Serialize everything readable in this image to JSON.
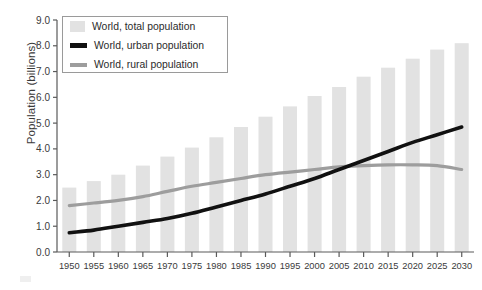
{
  "axes": {
    "ylabel": "Population (billions)",
    "yticks": [
      "0.0",
      "1.0",
      "2.0",
      "3.0",
      "4.0",
      "5.0",
      "6.0",
      "7.0",
      "8.0",
      "9.0"
    ],
    "xticks": [
      "1950",
      "1955",
      "1960",
      "1965",
      "1970",
      "1975",
      "1980",
      "1985",
      "1990",
      "1995",
      "2000",
      "2005",
      "2010",
      "2015",
      "2020",
      "2025",
      "2030"
    ]
  },
  "legend": {
    "items": [
      {
        "label": "World, total population",
        "marker": "total-swatch-icon"
      },
      {
        "label": "World, urban population",
        "marker": "urban-line-icon"
      },
      {
        "label": "World, rural population",
        "marker": "rural-line-icon"
      }
    ]
  },
  "colors": {
    "bar": "#e2e2e2",
    "urban": "#111111",
    "rural": "#9d9d9d",
    "axis": "#5a5a5a",
    "text": "#3a3a3a",
    "background": "#ffffff"
  },
  "chart_data": {
    "type": "bar",
    "title": "",
    "xlabel": "",
    "ylabel": "Population (billions)",
    "ylim": [
      0,
      9
    ],
    "xlim": [
      1950,
      2030
    ],
    "grid": false,
    "legend_position": "top-left",
    "categories": [
      "1950",
      "1955",
      "1960",
      "1965",
      "1970",
      "1975",
      "1980",
      "1985",
      "1990",
      "1995",
      "2000",
      "2005",
      "2010",
      "2015",
      "2020",
      "2025",
      "2030"
    ],
    "series": [
      {
        "name": "World, total population",
        "render": "bar",
        "color": "#e2e2e2",
        "values": [
          2.5,
          2.75,
          3.0,
          3.35,
          3.7,
          4.05,
          4.45,
          4.85,
          5.25,
          5.65,
          6.05,
          6.4,
          6.8,
          7.15,
          7.5,
          7.85,
          8.1
        ]
      },
      {
        "name": "World, urban population",
        "render": "line",
        "color": "#111111",
        "values": [
          0.75,
          0.85,
          1.0,
          1.15,
          1.3,
          1.5,
          1.75,
          2.0,
          2.25,
          2.55,
          2.85,
          3.2,
          3.55,
          3.9,
          4.25,
          4.55,
          4.85
        ]
      },
      {
        "name": "World, rural population",
        "render": "line",
        "color": "#9d9d9d",
        "values": [
          1.8,
          1.9,
          2.0,
          2.15,
          2.35,
          2.55,
          2.7,
          2.85,
          3.0,
          3.1,
          3.2,
          3.3,
          3.35,
          3.38,
          3.38,
          3.35,
          3.2
        ]
      }
    ]
  }
}
